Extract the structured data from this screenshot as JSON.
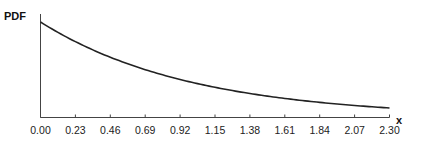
{
  "chart_data": {
    "type": "line",
    "title": "",
    "xlabel": "x",
    "ylabel": "PDF",
    "x_ticks": [
      "0.00",
      "0.23",
      "0.46",
      "0.69",
      "0.92",
      "1.15",
      "1.38",
      "1.61",
      "1.84",
      "2.07",
      "2.30"
    ],
    "xlim": [
      0,
      2.3
    ],
    "ylim": [
      0,
      1.0
    ],
    "grid": false,
    "legend": null,
    "series": [
      {
        "name": "PDF",
        "x": [
          0.0,
          0.23,
          0.46,
          0.69,
          0.92,
          1.15,
          1.38,
          1.61,
          1.84,
          2.07,
          2.3
        ],
        "values": [
          1.0,
          0.79,
          0.63,
          0.5,
          0.4,
          0.32,
          0.25,
          0.2,
          0.16,
          0.13,
          0.1
        ]
      }
    ],
    "y_ticks_shown": false
  },
  "labels": {
    "y_axis": "PDF",
    "x_axis": "x"
  }
}
